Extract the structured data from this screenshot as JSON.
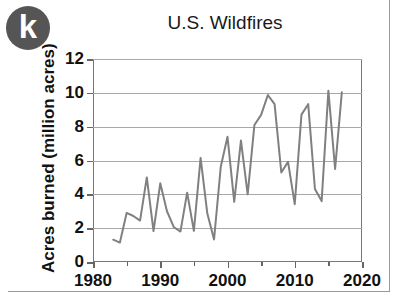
{
  "logo": {
    "text": "k",
    "color": "#555555",
    "name": "k-logo-badge"
  },
  "chart_data": {
    "type": "line",
    "title": "U.S. Wildfires",
    "xlabel": "",
    "ylabel": "Acres burned (million acres)",
    "xlim": [
      1980,
      2020
    ],
    "ylim": [
      0,
      12
    ],
    "grid": true,
    "legend": "none",
    "line_color": "#808080",
    "x_ticks": [
      1980,
      1990,
      2000,
      2010,
      2020
    ],
    "x_tick_labels": [
      "1980",
      "1990",
      "2000",
      "2010",
      "2020"
    ],
    "x_minor_ticks": [
      1985,
      1995,
      2005,
      2015
    ],
    "y_ticks": [
      0,
      2,
      4,
      6,
      8,
      10,
      12
    ],
    "y_tick_labels": [
      "0",
      "2",
      "4",
      "6",
      "8",
      "10",
      "12"
    ],
    "series": [
      {
        "name": "Acres burned",
        "x": [
          1983,
          1984,
          1985,
          1986,
          1987,
          1988,
          1989,
          1990,
          1991,
          1992,
          1993,
          1994,
          1995,
          1996,
          1997,
          1998,
          1999,
          2000,
          2001,
          2002,
          2003,
          2004,
          2005,
          2006,
          2007,
          2008,
          2009,
          2010,
          2011,
          2012,
          2013,
          2014,
          2015,
          2016,
          2017
        ],
        "values": [
          1.32,
          1.15,
          2.9,
          2.72,
          2.45,
          5.0,
          1.83,
          4.65,
          3.0,
          2.07,
          1.8,
          4.1,
          1.84,
          6.15,
          2.86,
          1.33,
          5.63,
          7.4,
          3.56,
          7.18,
          4.0,
          8.1,
          8.7,
          9.87,
          9.33,
          5.29,
          5.92,
          3.42,
          8.71,
          9.33,
          4.32,
          3.6,
          10.13,
          5.5,
          10.03
        ]
      }
    ]
  }
}
